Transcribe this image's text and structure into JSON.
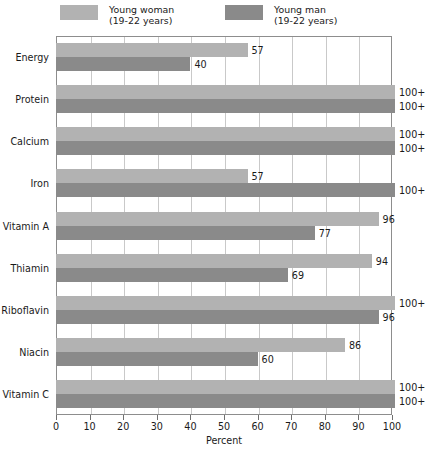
{
  "chart_data": {
    "type": "bar",
    "orientation": "horizontal",
    "title": "",
    "xlabel": "Percent",
    "ylabel": "",
    "xlim": [
      0,
      100
    ],
    "xticks": [
      0,
      10,
      20,
      30,
      40,
      50,
      60,
      70,
      80,
      90,
      100
    ],
    "grid": true,
    "legend_position": "top",
    "categories": [
      "Energy",
      "Protein",
      "Calcium",
      "Iron",
      "Vitamin A",
      "Thiamin",
      "Riboflavin",
      "Niacin",
      "Vitamin C"
    ],
    "series": [
      {
        "name": "Young woman",
        "subtitle": "(19-22 years)",
        "color": "#b2b2b2",
        "values": [
          57,
          100,
          100,
          57,
          96,
          94,
          100,
          86,
          100
        ],
        "labels": [
          "57",
          "100+",
          "100+",
          "57",
          "96",
          "94",
          "100+",
          "86",
          "100+"
        ]
      },
      {
        "name": "Young man",
        "subtitle": "(19-22 years)",
        "color": "#8a8a8a",
        "values": [
          40,
          100,
          100,
          100,
          77,
          69,
          96,
          60,
          100
        ],
        "labels": [
          "40",
          "100+",
          "100+",
          "100+",
          "77",
          "69",
          "96",
          "60",
          "100+"
        ]
      }
    ]
  },
  "legend": {
    "items": [
      {
        "label": "Young woman",
        "sublabel": "(19-22 years)",
        "color": "#b2b2b2"
      },
      {
        "label": "Young man",
        "sublabel": "(19-22 years)",
        "color": "#8a8a8a"
      }
    ]
  },
  "colors": {
    "series_light": "#b2b2b2",
    "series_dark": "#8a8a8a",
    "gridline": "#c9c9c9",
    "axis": "#8d8d8d",
    "text": "#1a1a1a"
  }
}
